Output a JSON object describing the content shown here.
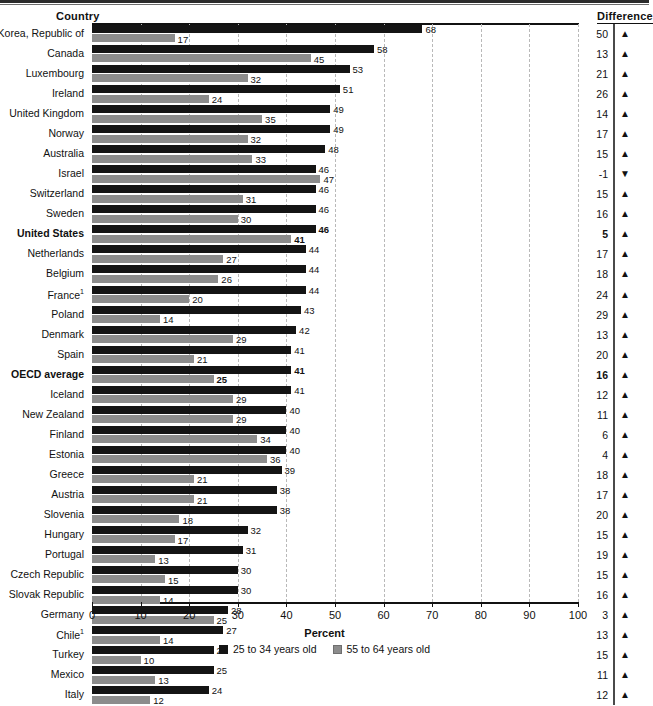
{
  "header": {
    "country_label": "Country",
    "difference_label": "Difference"
  },
  "axis": {
    "title": "Percent",
    "ticks": [
      "0",
      "10",
      "20",
      "30",
      "40",
      "50",
      "60",
      "70",
      "80",
      "90",
      "100"
    ]
  },
  "legend": {
    "items": [
      {
        "label": "25 to 34 years old",
        "color": "#141414",
        "key": "young"
      },
      {
        "label": "55 to 64 years old",
        "color": "#8c8c8c",
        "key": "old"
      }
    ]
  },
  "colors": {
    "young_bar": "#141414",
    "old_bar": "#8c8c8c",
    "gridline": "#b9b9b9",
    "axis": "#111111"
  },
  "icons": {
    "up_arrow": "▲",
    "down_arrow": "▼"
  },
  "chart_data": {
    "type": "bar",
    "orientation": "horizontal",
    "title": "",
    "xlabel": "Percent",
    "ylabel": "Country",
    "xlim": [
      0,
      100
    ],
    "grid": true,
    "legend_position": "bottom",
    "categories": [
      "Korea, Republic of",
      "Canada",
      "Luxembourg",
      "Ireland",
      "United Kingdom",
      "Norway",
      "Australia",
      "Israel",
      "Switzerland",
      "Sweden",
      "United States",
      "Netherlands",
      "Belgium",
      "France¹",
      "Poland",
      "Denmark",
      "Spain",
      "OECD average",
      "Iceland",
      "New Zealand",
      "Finland",
      "Estonia",
      "Greece",
      "Austria",
      "Slovenia",
      "Hungary",
      "Portugal",
      "Czech Republic",
      "Slovak Republic",
      "Germany",
      "Chile¹",
      "Turkey",
      "Mexico",
      "Italy"
    ],
    "series": [
      {
        "name": "25 to 34 years old",
        "color": "#141414",
        "values": [
          68,
          58,
          53,
          51,
          49,
          49,
          48,
          46,
          46,
          46,
          46,
          44,
          44,
          44,
          43,
          42,
          41,
          41,
          41,
          40,
          40,
          40,
          39,
          38,
          38,
          32,
          31,
          30,
          30,
          28,
          27,
          25,
          25,
          24
        ]
      },
      {
        "name": "55 to 64 years old",
        "color": "#8c8c8c",
        "values": [
          17,
          45,
          32,
          24,
          35,
          32,
          33,
          47,
          31,
          30,
          41,
          27,
          26,
          20,
          14,
          29,
          21,
          25,
          29,
          29,
          34,
          36,
          21,
          21,
          18,
          17,
          13,
          15,
          14,
          25,
          14,
          10,
          13,
          12
        ]
      }
    ],
    "difference": [
      50,
      13,
      21,
      26,
      14,
      17,
      15,
      -1,
      15,
      16,
      5,
      17,
      18,
      24,
      29,
      13,
      20,
      16,
      12,
      11,
      6,
      4,
      18,
      17,
      20,
      15,
      19,
      15,
      16,
      3,
      13,
      15,
      11,
      12
    ],
    "difference_direction": [
      "up",
      "up",
      "up",
      "up",
      "up",
      "up",
      "up",
      "down",
      "up",
      "up",
      "up",
      "up",
      "up",
      "up",
      "up",
      "up",
      "up",
      "up",
      "up",
      "up",
      "up",
      "up",
      "up",
      "up",
      "up",
      "up",
      "up",
      "up",
      "up",
      "up",
      "up",
      "up",
      "up",
      "up"
    ],
    "highlighted_rows": [
      "United States",
      "OECD average"
    ]
  }
}
